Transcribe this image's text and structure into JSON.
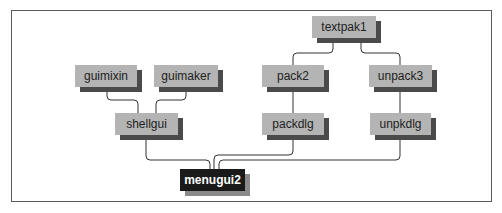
{
  "diagram": {
    "title": "",
    "type": "module dependency graph",
    "nodes": [
      {
        "id": "textpak1",
        "label": "textpak1",
        "x": 312,
        "y": 16,
        "w": 64,
        "style": "light"
      },
      {
        "id": "guimixin",
        "label": "guimixin",
        "x": 75,
        "y": 65,
        "w": 62,
        "style": "light"
      },
      {
        "id": "guimaker",
        "label": "guimaker",
        "x": 154,
        "y": 65,
        "w": 64,
        "style": "light"
      },
      {
        "id": "pack2",
        "label": "pack2",
        "x": 262,
        "y": 65,
        "w": 62,
        "style": "light"
      },
      {
        "id": "unpack3",
        "label": "unpack3",
        "x": 369,
        "y": 65,
        "w": 63,
        "style": "light"
      },
      {
        "id": "shellgui",
        "label": "shellgui",
        "x": 115,
        "y": 113,
        "w": 63,
        "style": "light"
      },
      {
        "id": "packdlg",
        "label": "packdlg",
        "x": 262,
        "y": 113,
        "w": 62,
        "style": "light"
      },
      {
        "id": "unpkdlg",
        "label": "unpkdlg",
        "x": 370,
        "y": 113,
        "w": 61,
        "style": "light"
      },
      {
        "id": "menugui2",
        "label": "menugui2",
        "x": 180,
        "y": 169,
        "w": 65,
        "style": "dark"
      }
    ],
    "edges": [
      {
        "from": "shellgui",
        "to": "guimixin"
      },
      {
        "from": "shellgui",
        "to": "guimaker"
      },
      {
        "from": "pack2",
        "to": "textpak1"
      },
      {
        "from": "unpack3",
        "to": "textpak1"
      },
      {
        "from": "packdlg",
        "to": "pack2"
      },
      {
        "from": "unpkdlg",
        "to": "unpack3"
      },
      {
        "from": "menugui2",
        "to": "shellgui"
      },
      {
        "from": "menugui2",
        "to": "packdlg"
      },
      {
        "from": "menugui2",
        "to": "unpkdlg"
      }
    ],
    "colors": {
      "node_fill": "#b4b4b4",
      "node_shadow": "#4a4a4a",
      "root_fill": "#1a1a1a",
      "root_text": "#ffffff",
      "edge": "#333333",
      "frame": "#5a5a5a"
    }
  }
}
